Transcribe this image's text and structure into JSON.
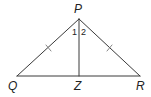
{
  "diagram": {
    "type": "geometry-triangle",
    "stroke_color": "#3a3a3a",
    "vertices": {
      "P": {
        "label": "P",
        "x": 79,
        "y": 19
      },
      "Q": {
        "label": "Q",
        "x": 17,
        "y": 76
      },
      "R": {
        "label": "R",
        "x": 140,
        "y": 76
      },
      "Z": {
        "label": "Z",
        "x": 79,
        "y": 76
      }
    },
    "segments": [
      {
        "from": "P",
        "to": "Q",
        "congruence_ticks": 1
      },
      {
        "from": "P",
        "to": "R",
        "congruence_ticks": 1
      },
      {
        "from": "Q",
        "to": "R",
        "congruence_ticks": 0
      },
      {
        "from": "P",
        "to": "Z",
        "congruence_ticks": 0
      }
    ],
    "angles": [
      {
        "label": "1",
        "vertex": "P",
        "between": [
          "PQ",
          "PZ"
        ]
      },
      {
        "label": "2",
        "vertex": "P",
        "between": [
          "PZ",
          "PR"
        ]
      }
    ]
  }
}
